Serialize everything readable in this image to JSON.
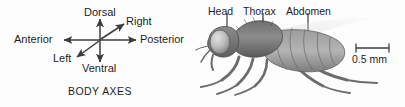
{
  "figure": {
    "background_color": "#fdfdfd",
    "text_color": "#1d1d1d",
    "line_color": "#3b3b3b"
  },
  "body_axes": {
    "caption": "BODY AXES",
    "labels": {
      "dorsal": "Dorsal",
      "ventral": "Ventral",
      "anterior": "Anterior",
      "posterior": "Posterior",
      "right": "Right",
      "left": "Left"
    },
    "arrows": [
      {
        "name": "vertical-axis",
        "from_label": "Ventral",
        "to_label": "Dorsal"
      },
      {
        "name": "horizontal-axis",
        "from_label": "Anterior",
        "to_label": "Posterior"
      },
      {
        "name": "diagonal-axis",
        "from_label": "Left",
        "to_label": "Right"
      }
    ]
  },
  "fly": {
    "organism": "fruit fly",
    "view": "lateral",
    "parts": [
      {
        "name": "head",
        "label": "Head"
      },
      {
        "name": "thorax",
        "label": "Thorax"
      },
      {
        "name": "abdomen",
        "label": "Abdomen"
      }
    ],
    "scale_bar": {
      "label": "0.5 mm",
      "value": 0.5,
      "unit": "mm"
    }
  }
}
